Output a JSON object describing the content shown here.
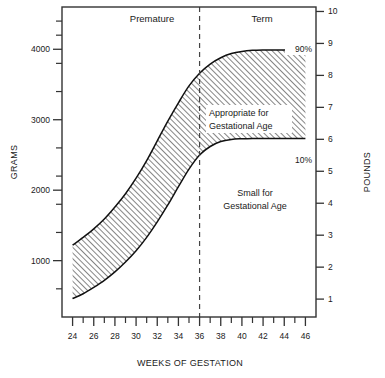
{
  "chart_data": {
    "type": "area",
    "title": "",
    "subtitle": "",
    "xlabel": "WEEKS OF GESTATION",
    "ylabel": "GRAMS",
    "y2label": "POUNDS",
    "xlim": [
      23,
      47
    ],
    "ylim": [
      200,
      4600
    ],
    "y2lim": [
      0.44,
      10.14
    ],
    "grid": false,
    "legend_position": "inline-annotations",
    "x_ticks_major": [
      24,
      26,
      28,
      30,
      32,
      34,
      36,
      38,
      40,
      42,
      44,
      46
    ],
    "x_ticks_minor": [
      25,
      27,
      29,
      31,
      33,
      35,
      37,
      39,
      41,
      43,
      45
    ],
    "x_tick_labels": [
      "24",
      "26",
      "28",
      "30",
      "32",
      "34",
      "36",
      "38",
      "40",
      "42",
      "44",
      "46"
    ],
    "y_ticks_major": [
      1000,
      2000,
      3000,
      4000
    ],
    "y_tick_labels": [
      "1000",
      "2000",
      "3000",
      "4000"
    ],
    "y_ticks_minor": [
      600,
      1400,
      1800,
      2200,
      2600,
      3400,
      3800,
      4200,
      4400
    ],
    "y2_ticks": [
      1,
      2,
      3,
      4,
      5,
      6,
      7,
      8,
      9,
      10
    ],
    "y2_tick_labels": [
      "1",
      "2",
      "3",
      "4",
      "5",
      "6",
      "7",
      "8",
      "9",
      "10"
    ],
    "series": [
      {
        "name": "90%",
        "label": "90%",
        "x": [
          24,
          25,
          26,
          27,
          28,
          29,
          30,
          31,
          32,
          33,
          34,
          35,
          36,
          37,
          38,
          39,
          40,
          41,
          42,
          43,
          44,
          45,
          46
        ],
        "values": [
          1220,
          1330,
          1450,
          1590,
          1760,
          1950,
          2170,
          2420,
          2700,
          2980,
          3240,
          3480,
          3660,
          3790,
          3880,
          3940,
          3970,
          3985,
          3990,
          3990,
          3990,
          3990,
          3990
        ]
      },
      {
        "name": "10%",
        "label": "10%",
        "x": [
          24,
          25,
          26,
          27,
          28,
          29,
          30,
          31,
          32,
          33,
          34,
          35,
          36,
          37,
          38,
          39,
          40,
          41,
          42,
          43,
          44,
          45,
          46
        ],
        "values": [
          460,
          530,
          620,
          720,
          840,
          980,
          1140,
          1330,
          1550,
          1790,
          2050,
          2300,
          2500,
          2620,
          2690,
          2720,
          2730,
          2735,
          2735,
          2735,
          2735,
          2735,
          2735
        ]
      }
    ],
    "band_fill": "diagonal-hatch",
    "annotations": [
      {
        "name": "premature-label",
        "text": "Premature",
        "x": 30,
        "y": 4450
      },
      {
        "name": "term-label",
        "text": "Term",
        "x": 41,
        "y": 4450
      },
      {
        "name": "appropriate-label",
        "text": "Appropriate for\nGestational Age",
        "x": 40,
        "y": 3100
      },
      {
        "name": "small-label",
        "text": "Small for\nGestational Age",
        "x": 41,
        "y": 1850
      },
      {
        "name": "p90-label",
        "text": "90%",
        "x": 45.2,
        "y": 4180
      },
      {
        "name": "p10-label",
        "text": "10%",
        "x": 45.2,
        "y": 2560
      }
    ],
    "divider": {
      "name": "term-divider",
      "x": 36,
      "style": "dashed"
    }
  },
  "labels": {
    "premature": "Premature",
    "term": "Term",
    "appropriate_line1": "Appropriate for",
    "appropriate_line2": "Gestational Age",
    "small_line1": "Small for",
    "small_line2": "Gestational Age",
    "p90": "90%",
    "p10": "10%",
    "y_axis_title": "GRAMS",
    "y2_axis_title": "POUNDS",
    "x_axis_title": "WEEKS OF GESTATION"
  },
  "colors": {
    "ink": "#1a1a1a",
    "frame": "#333333",
    "hatch": "#4a4a4a",
    "background": "#ffffff"
  }
}
